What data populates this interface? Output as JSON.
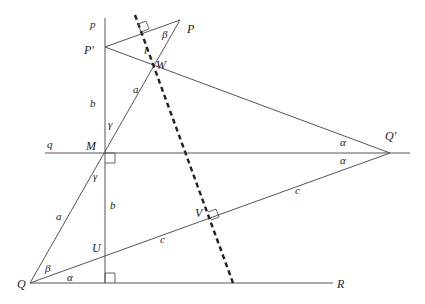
{
  "diagram": {
    "type": "geometry-construction",
    "points": {
      "P": "P",
      "P_prime": "P′",
      "W": "W",
      "M": "M",
      "Q": "Q",
      "Q_prime": "Q′",
      "U": "U",
      "V": "V",
      "R": "R"
    },
    "lines": {
      "p": "p",
      "q": "q"
    },
    "segment_labels": {
      "a_upper": "a",
      "a_lower": "a",
      "b_upper": "b",
      "b_lower": "b",
      "c_upper": "c",
      "c_lower": "c",
      "l": "l"
    },
    "angle_labels": {
      "beta_top": "β",
      "beta_bottom": "β",
      "gamma_upper": "γ",
      "gamma_lower": "γ",
      "alpha_upper_right": "α",
      "alpha_lower_right": "α",
      "alpha_bottom": "α"
    }
  }
}
